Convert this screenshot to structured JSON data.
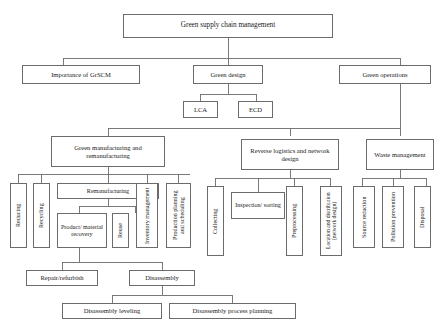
{
  "diagram": {
    "title": "Green supply chain management",
    "type": "hierarchy-tree",
    "orientation": "top-down",
    "line_color": "#6b6b6b",
    "background": "#ffffff",
    "text_color": "#1a1a1a",
    "nodes": {
      "root": "Green supply chain management",
      "importance": "Importance of GrSCM",
      "green_design": "Green design",
      "green_operations": "Green operations",
      "lca": "LCA",
      "ecd": "ECD",
      "green_manufacturing": "Green manufacturing and remanufacturing",
      "reverse_logistics": "Reverse logistics and network design",
      "waste_management": "Waste management",
      "reducing": "Reducing",
      "recycling": "Recycling",
      "remanufacturing": "Remanufacturing",
      "inventory_management": "Inventory management",
      "production_planning": "Production planning and scheduling",
      "product_material_recovery": "Product/ material recovery",
      "reuse": "Reuse",
      "collecting": "Collecting",
      "inspection_sorting": "Inspection/ sorting",
      "preprocessing": "Preprocessing",
      "location_distribution": "Location and distribution (network design)",
      "source_reduction": "Source reduction",
      "pollution_prevention": "Pollution prevention",
      "disposal": "Disposal",
      "repair_refurbish": "Repair/refurbish",
      "disassembly": "Disassembly",
      "disassembly_leveling": "Disassembly leveling",
      "disassembly_process_planning": "Disassembly process planning"
    }
  }
}
